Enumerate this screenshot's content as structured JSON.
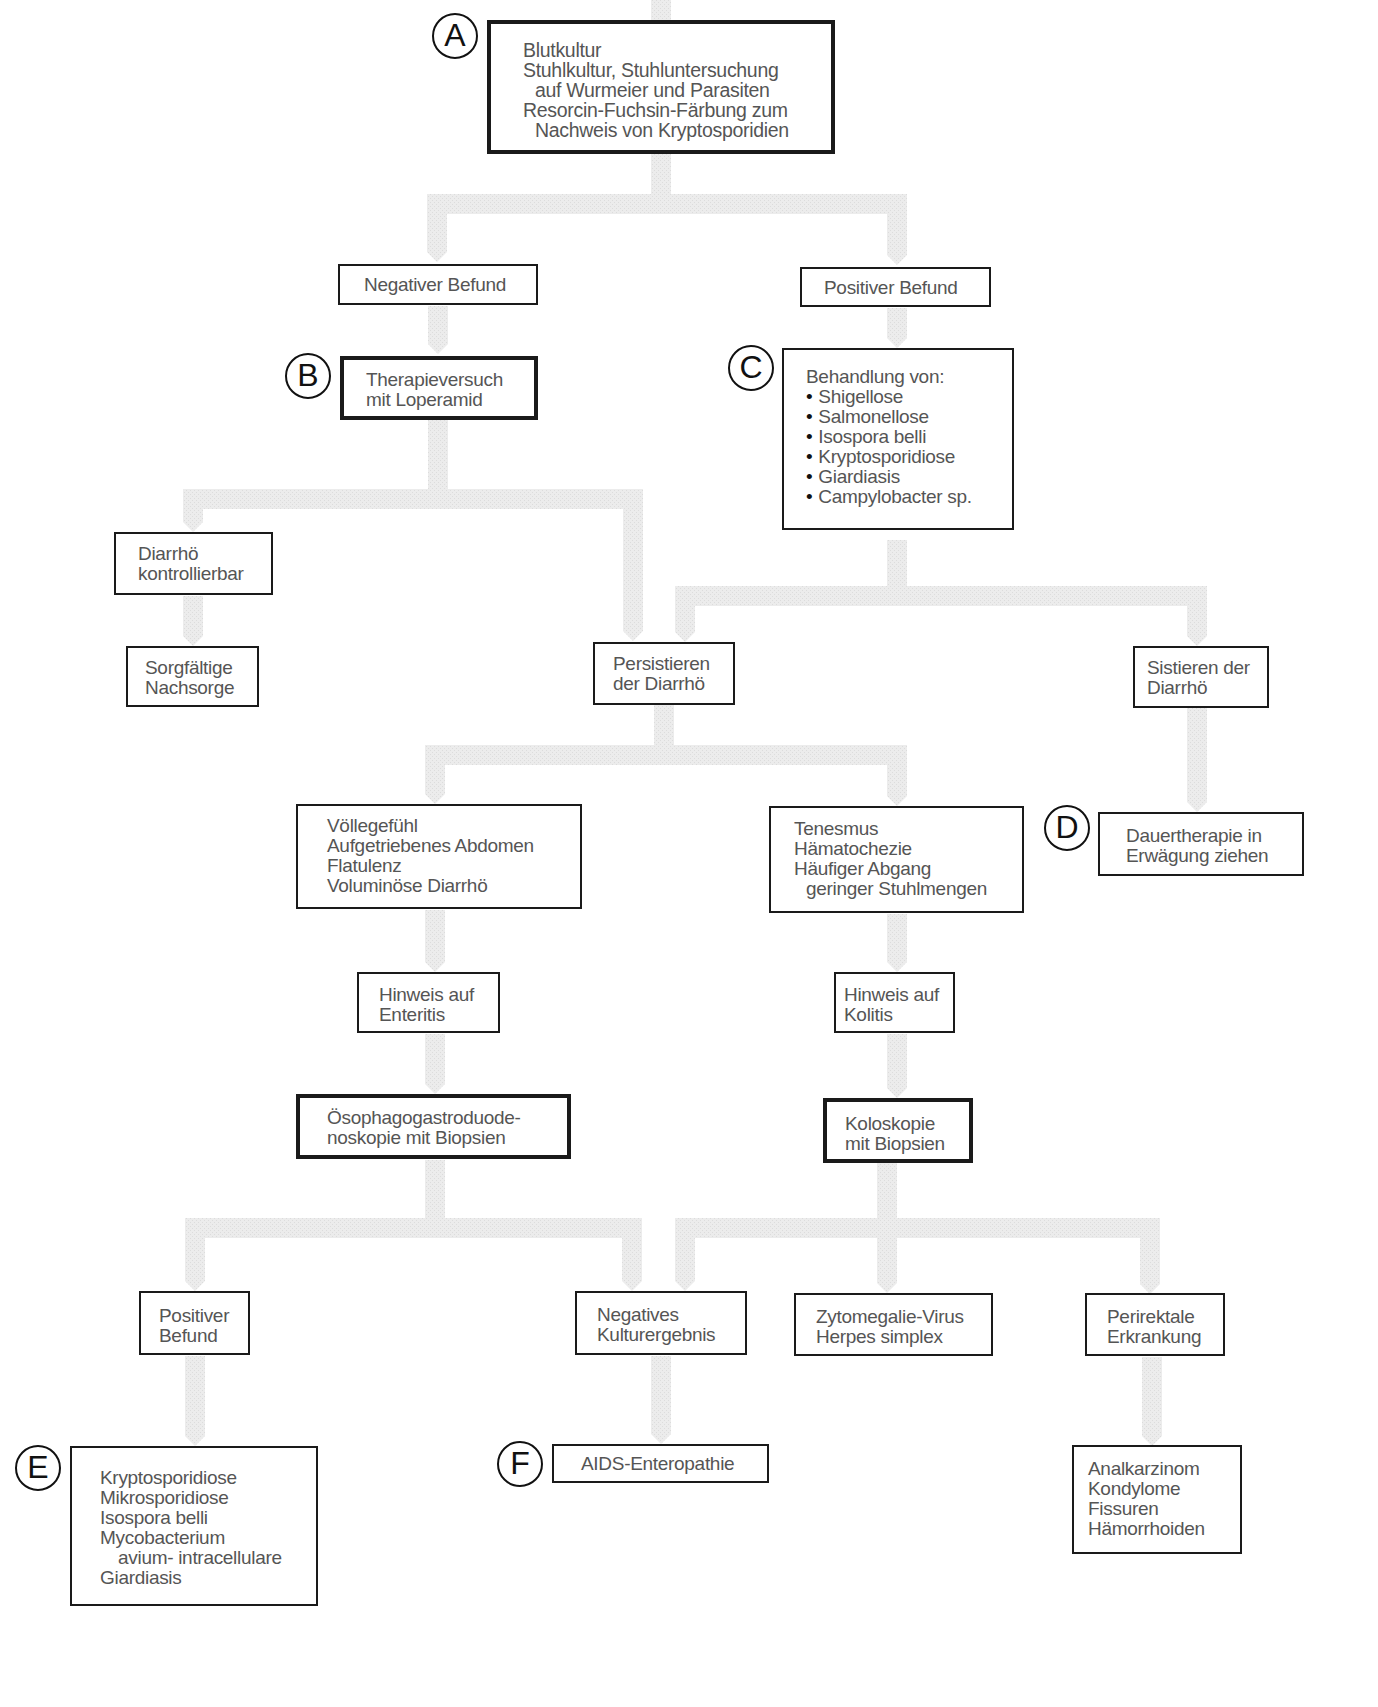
{
  "diagram": {
    "type": "flowchart",
    "language": "de",
    "connector_color": "#ebebeb",
    "border_color": "#1a1a1a",
    "text_color": "#555555"
  },
  "markers": {
    "A": "A",
    "B": "B",
    "C": "C",
    "D": "D",
    "E": "E",
    "F": "F"
  },
  "nodes": {
    "a_diagnostics": {
      "lines": [
        "Blutkultur",
        "Stuhlkultur, Stuhluntersuchung",
        "auf Wurmeier und Parasiten",
        "Resorcin-Fuchsin-Färbung zum",
        "Nachweis von Kryptosporidien"
      ]
    },
    "negative_finding": {
      "lines": [
        "Negativer Befund"
      ]
    },
    "positive_finding": {
      "lines": [
        "Positiver Befund"
      ]
    },
    "b_therapy_trial": {
      "lines": [
        "Therapieversuch",
        "mit Loperamid"
      ]
    },
    "c_treatment": {
      "title": "Behandlung von:",
      "items": [
        "Shigellose",
        "Salmonellose",
        "Isospora belli",
        "Kryptosporidiose",
        "Giardiasis",
        "Campylobacter sp."
      ]
    },
    "diarrhea_controllable": {
      "lines": [
        "Diarrhö",
        "kontrollierbar"
      ]
    },
    "careful_followup": {
      "lines": [
        "Sorgfältige",
        "Nachsorge"
      ]
    },
    "persistent_diarrhea": {
      "lines": [
        "Persistieren",
        "der Diarrhö"
      ]
    },
    "diarrhea_stops": {
      "lines": [
        "Sistieren der",
        "Diarrhö"
      ]
    },
    "d_long_term": {
      "lines": [
        "Dauertherapie in",
        "Erwägung ziehen"
      ]
    },
    "enteritis_symptoms": {
      "lines": [
        "Völlegefühl",
        "Aufgetriebenes Abdomen",
        "Flatulenz",
        "Voluminöse Diarrhö"
      ]
    },
    "colitis_symptoms": {
      "lines": [
        "Tenesmus",
        "Hämatochezie",
        "Häufiger Abgang",
        "geringer Stuhlmengen"
      ]
    },
    "enteritis_hint": {
      "lines": [
        "Hinweis auf",
        "Enteritis"
      ]
    },
    "colitis_hint": {
      "lines": [
        "Hinweis auf",
        "Kolitis"
      ]
    },
    "egd_biopsy": {
      "lines": [
        "Ösophagogastroduode-",
        "noskopie mit Biopsien"
      ]
    },
    "colonoscopy_biopsy": {
      "lines": [
        "Koloskopie",
        "mit Biopsien"
      ]
    },
    "positive_finding_2": {
      "lines": [
        "Positiver",
        "Befund"
      ]
    },
    "negative_culture": {
      "lines": [
        "Negatives",
        "Kulturergebnis"
      ]
    },
    "cmv_hsv": {
      "lines": [
        "Zytomegalie-Virus",
        "Herpes simplex"
      ]
    },
    "perirectal": {
      "lines": [
        "Perirektale",
        "Erkrankung"
      ]
    },
    "e_pathogens": {
      "lines": [
        "Kryptosporidiose",
        "Mikrosporidiose",
        "Isospora belli",
        "Mycobacterium",
        "avium- intracellulare",
        "Giardiasis"
      ]
    },
    "f_aids_enteropathy": {
      "lines": [
        "AIDS-Enteropathie"
      ]
    },
    "perirectal_findings": {
      "lines": [
        "Analkarzinom",
        "Kondylome",
        "Fissuren",
        "Hämorrhoiden"
      ]
    }
  }
}
